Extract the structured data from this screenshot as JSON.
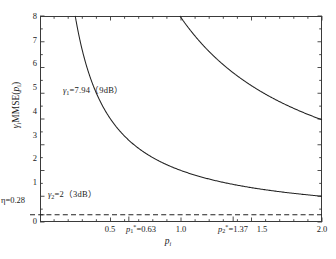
{
  "chart_data": {
    "type": "line",
    "title": "",
    "xlabel": "p_i",
    "ylabel": "gamma_i MMSE(p_i)",
    "xlim": [
      0,
      2.0
    ],
    "ylim": [
      0,
      8
    ],
    "grid": false,
    "legend": "none",
    "x_ticks": [
      0.5,
      1.0,
      1.5,
      2.0
    ],
    "x_tick_labels": [
      "0.5",
      "1.0",
      "1.5",
      "2.0"
    ],
    "y_ticks": [
      0,
      1,
      2,
      3,
      4,
      5,
      6,
      7,
      8
    ],
    "y_tick_labels": [
      "0",
      "1",
      "2",
      "3",
      "4",
      "5",
      "6",
      "7",
      "8"
    ],
    "extra_y_tick": {
      "value": 0.28,
      "label": "0.28"
    },
    "series": [
      {
        "name": "gamma1",
        "gamma": 7.94,
        "db": "9dB",
        "style": "solid",
        "color": "#222222",
        "formula": "gamma/p",
        "x": [
          0.992,
          1.1,
          1.3,
          1.5,
          1.8,
          2.2,
          2.6,
          3.0,
          3.5,
          4.0,
          5.0,
          6.0,
          7.0,
          8.0,
          9.93,
          12.0,
          15.0,
          20.0,
          25.0,
          31.5
        ],
        "values": [
          8.0,
          7.22,
          6.11,
          5.29,
          4.41,
          3.61,
          3.05,
          2.65,
          2.27,
          1.99,
          1.59,
          1.32,
          1.13,
          0.99,
          0.8,
          0.66,
          0.53,
          0.4,
          0.32,
          0.25
        ]
      },
      {
        "name": "gamma2",
        "gamma": 2,
        "db": "3dB",
        "style": "solid",
        "color": "#222222",
        "formula": "gamma/p",
        "x": [
          1.0,
          1.2,
          1.5,
          2.0,
          2.5,
          3.0,
          4.0,
          5.0,
          6.3,
          8.0,
          10.0,
          13.0,
          16.0,
          20.0,
          25.0,
          31.5
        ],
        "values": [
          2.0,
          1.67,
          1.33,
          1.0,
          0.8,
          0.67,
          0.5,
          0.4,
          0.32,
          0.25,
          0.2,
          0.154,
          0.125,
          0.1,
          0.08,
          0.063
        ]
      }
    ],
    "hline": {
      "name": "eta",
      "value": 0.28,
      "label": "eta=0.28",
      "style": "dashed",
      "color": "#222222"
    },
    "annotations": [
      {
        "name": "gamma1-annotation",
        "text": "γ₁=7.94（9dB）",
        "x": 0.26,
        "y": 4.9
      },
      {
        "name": "gamma2-annotation",
        "text": "γ₂=2（3dB）",
        "x": 0.075,
        "y": 0.9
      },
      {
        "name": "eta-annotation",
        "text": "η=0.28",
        "x": -0.28,
        "y": 0.28
      }
    ],
    "marked_x": [
      {
        "name": "p1-star",
        "label": "p₁*=0.63",
        "value": 0.63
      },
      {
        "name": "p2-star",
        "label": "p₂*=1.37",
        "value": 1.37
      }
    ]
  },
  "labels": {
    "y_ticks": [
      "8",
      "7",
      "6",
      "5",
      "4",
      "3",
      "2",
      "1",
      "0"
    ],
    "eta_tick": "0.28",
    "x": {
      "t05": "0.5",
      "p1star_pre": "p",
      "p1star_sub": "1",
      "p1star_sup": "*",
      "p1star_val": "=0.63",
      "t10": "1.0",
      "p2star_pre": "p",
      "p2star_sub": "2",
      "p2star_sup": "*",
      "p2star_val": "=1.37",
      "t15": "1.5",
      "t20": "2.0"
    },
    "xtitle_p": "p",
    "xtitle_sub": "i",
    "ytitle_g": "γ",
    "ytitle_gsub": "i",
    "ytitle_mid": "MMSE(",
    "ytitle_p": "p",
    "ytitle_psub": "i",
    "ytitle_close": ")",
    "ann1_g": "γ",
    "ann1_sub": "1",
    "ann1_rest": "=7.94（9dB）",
    "ann2_g": "γ",
    "ann2_sub": "2",
    "ann2_rest": "=2（3dB）",
    "eta_g": "η",
    "eta_rest": "=0.28"
  },
  "colors": {
    "curve": "#222222",
    "frame": "#3a3a3a",
    "dash": "#222222",
    "background": "#ffffff"
  }
}
